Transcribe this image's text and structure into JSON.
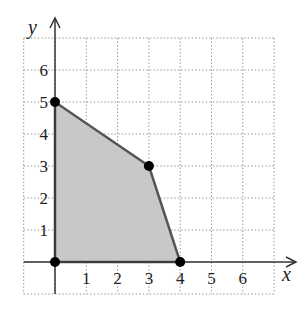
{
  "chart_data": {
    "type": "area",
    "title": "",
    "xlabel": "x",
    "ylabel": "y",
    "xlim": [
      -1,
      7
    ],
    "ylim": [
      -1,
      7
    ],
    "grid": true,
    "x_ticks": [
      "1",
      "2",
      "3",
      "4",
      "5",
      "6"
    ],
    "y_ticks": [
      "1",
      "2",
      "3",
      "4",
      "5",
      "6"
    ],
    "region_vertices": [
      [
        0,
        0
      ],
      [
        0,
        5
      ],
      [
        3,
        3
      ],
      [
        4,
        0
      ]
    ],
    "points": [
      {
        "x": 0,
        "y": 0
      },
      {
        "x": 0,
        "y": 5
      },
      {
        "x": 3,
        "y": 3
      },
      {
        "x": 4,
        "y": 0
      }
    ],
    "colors": {
      "fill": "#c8c8c8",
      "edge": "#555555",
      "grid": "#999999",
      "point": "#000000"
    }
  }
}
